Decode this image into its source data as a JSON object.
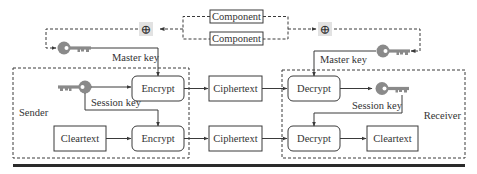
{
  "diagram": {
    "type": "key-distribution-flow",
    "colors": {
      "stroke": "#3a3a3a",
      "text": "#333333",
      "key_fill": "#8a8a8a",
      "xor_bg": "#e2e2e2",
      "rule": "#2a2a2a"
    },
    "components": [
      {
        "id": "component-top",
        "label": "Component"
      },
      {
        "id": "component-bottom",
        "label": "Component"
      }
    ],
    "xor_symbol": "⊕",
    "groups": {
      "sender": {
        "label": "Sender"
      },
      "receiver": {
        "label": "Receiver"
      }
    },
    "nodes": {
      "sender_encrypt_key": {
        "label": "Encrypt"
      },
      "sender_encrypt_data": {
        "label": "Encrypt"
      },
      "sender_cleartext": {
        "label": "Cleartext"
      },
      "ciphertext_key": {
        "label": "Ciphertext"
      },
      "ciphertext_data": {
        "label": "Ciphertext"
      },
      "receiver_decrypt_key": {
        "label": "Decrypt"
      },
      "receiver_decrypt_data": {
        "label": "Decrypt"
      },
      "receiver_cleartext": {
        "label": "Cleartext"
      }
    },
    "labels": {
      "sender_master_key": "Master key",
      "sender_session_key": "Session key",
      "receiver_master_key": "Master key",
      "receiver_session_key": "Session key"
    },
    "edges": [
      {
        "from": "component-top",
        "to": "xor-left",
        "style": "dashed"
      },
      {
        "from": "component-bottom",
        "to": "xor-left",
        "style": "dashed"
      },
      {
        "from": "component-top",
        "to": "xor-right",
        "style": "dashed"
      },
      {
        "from": "component-bottom",
        "to": "xor-right",
        "style": "dashed"
      },
      {
        "from": "xor-left",
        "to": "sender-master-key",
        "style": "dashed"
      },
      {
        "from": "xor-right",
        "to": "receiver-master-key",
        "style": "dashed"
      },
      {
        "from": "sender-master-key",
        "to": "sender_encrypt_key",
        "label": "Master key"
      },
      {
        "from": "sender-session-key",
        "to": "sender_encrypt_key"
      },
      {
        "from": "sender-session-key",
        "to": "sender_encrypt_data",
        "label": "Session key"
      },
      {
        "from": "sender_cleartext",
        "to": "sender_encrypt_data"
      },
      {
        "from": "sender_encrypt_key",
        "to": "ciphertext_key"
      },
      {
        "from": "sender_encrypt_data",
        "to": "ciphertext_data"
      },
      {
        "from": "ciphertext_key",
        "to": "receiver_decrypt_key"
      },
      {
        "from": "ciphertext_data",
        "to": "receiver_decrypt_data"
      },
      {
        "from": "receiver-master-key",
        "to": "receiver_decrypt_key",
        "label": "Master key"
      },
      {
        "from": "receiver_decrypt_key",
        "to": "receiver-session-key"
      },
      {
        "from": "receiver-session-key",
        "to": "receiver_decrypt_data",
        "label": "Session key"
      },
      {
        "from": "receiver_decrypt_data",
        "to": "receiver_cleartext"
      }
    ]
  }
}
